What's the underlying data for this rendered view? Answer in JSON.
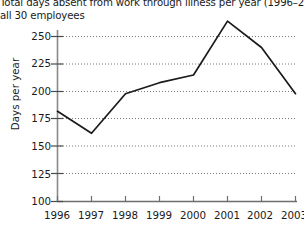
{
  "chart_data": {
    "type": "line",
    "title": "Total days absent from work through illness per year (1996–2003)",
    "subtitle": "all 30 employees",
    "xlabel": "",
    "ylabel": "Days per year",
    "categories": [
      "1996",
      "1997",
      "1998",
      "1999",
      "2000",
      "2001",
      "2002",
      "2003"
    ],
    "values": [
      182,
      162,
      198,
      208,
      215,
      264,
      240,
      198
    ],
    "series": [
      {
        "name": "Days absent",
        "values": [
          182,
          162,
          198,
          208,
          215,
          264,
          240,
          198
        ]
      }
    ],
    "ylim": [
      100,
      270
    ],
    "yticks": [
      100,
      125,
      150,
      175,
      200,
      225,
      250
    ],
    "ytick_labels": [
      "100",
      "125",
      "150",
      "175",
      "200",
      "225",
      "250"
    ],
    "xtick_labels": [
      "1996",
      "1997",
      "1998",
      "1999",
      "2000",
      "2001",
      "2002",
      "2003"
    ],
    "grid": "horizontal-dotted",
    "legend": "none",
    "line_color": "#1a1a1a",
    "grid_color": "#7a7a7a",
    "axis_color": "#6e6e6e",
    "background": "#ffffff"
  }
}
